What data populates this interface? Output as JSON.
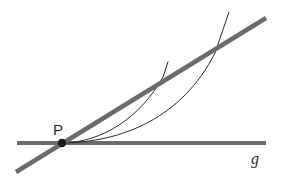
{
  "figure": {
    "width": 281,
    "height": 191,
    "background_color": "#ffffff"
  },
  "colors": {
    "thick_line": "#6b6b6b",
    "thin_curve": "#2b2b2b",
    "point_fill": "#1a1a1a",
    "label": "#2b2b2b"
  },
  "labels": {
    "point_p": "P",
    "line_g": "g"
  },
  "chart_data": {
    "type": "line",
    "title": "",
    "xlabel": "",
    "ylabel": "",
    "grid": false,
    "legend": "none",
    "elements": [
      {
        "name": "horizontal-line-g",
        "kind": "straight-line",
        "label": "g",
        "stroke": "#6b6b6b",
        "stroke_width": 4,
        "x1": 17,
        "y1": 143,
        "x2": 266,
        "y2": 143
      },
      {
        "name": "secant-line",
        "kind": "straight-line",
        "label": "",
        "stroke": "#6b6b6b",
        "stroke_width": 4.5,
        "x1": 16,
        "y1": 172,
        "x2": 266,
        "y2": 18
      },
      {
        "name": "curve-inner",
        "kind": "curve",
        "label": "",
        "stroke": "#2b2b2b",
        "stroke_width": 1,
        "path": "M 62 143 C 100 142 140 118 168 62"
      },
      {
        "name": "curve-outer",
        "kind": "curve",
        "label": "",
        "stroke": "#2b2b2b",
        "stroke_width": 1,
        "path": "M 62 143 C 120 142 190 122 229 12"
      },
      {
        "name": "point-p",
        "kind": "point",
        "label": "P",
        "fill": "#1a1a1a",
        "x": 62,
        "y": 143,
        "radius": 4
      }
    ],
    "annotations": [
      {
        "text": "P",
        "x": 53,
        "y": 122,
        "style": "sans"
      },
      {
        "text": "g",
        "x": 251,
        "y": 151,
        "style": "serif-italic"
      }
    ]
  }
}
